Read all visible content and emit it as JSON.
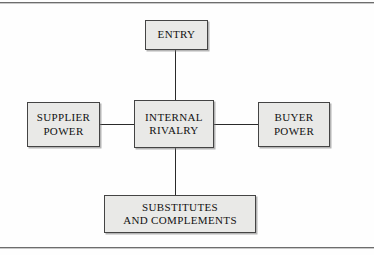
{
  "diagram": {
    "background_color": "#fefefe",
    "node_fill_color": "#e9e9e7",
    "node_border_color": "#444444",
    "connector_color": "#2a2a2a",
    "frame_rule_color": "#6d6d6d",
    "nodes": [
      {
        "id": "entry",
        "label": "ENTRY",
        "position": "top"
      },
      {
        "id": "supplier-power",
        "label": "SUPPLIER\nPOWER",
        "position": "left"
      },
      {
        "id": "internal-rivalry",
        "label": "INTERNAL\nRIVALRY",
        "position": "center"
      },
      {
        "id": "buyer-power",
        "label": "BUYER\nPOWER",
        "position": "right"
      },
      {
        "id": "substitutes-and-complements",
        "label": "SUBSTITUTES\nAND COMPLEMENTS",
        "position": "bottom"
      }
    ],
    "connectors": [
      {
        "id": "entry-to-rivalry",
        "from": "entry",
        "to": "internal-rivalry",
        "orientation": "vertical"
      },
      {
        "id": "supplier-to-rivalry",
        "from": "supplier-power",
        "to": "internal-rivalry",
        "orientation": "horizontal"
      },
      {
        "id": "rivalry-to-buyer",
        "from": "internal-rivalry",
        "to": "buyer-power",
        "orientation": "horizontal"
      },
      {
        "id": "rivalry-to-substitutes",
        "from": "internal-rivalry",
        "to": "substitutes-and-complements",
        "orientation": "vertical"
      }
    ]
  }
}
